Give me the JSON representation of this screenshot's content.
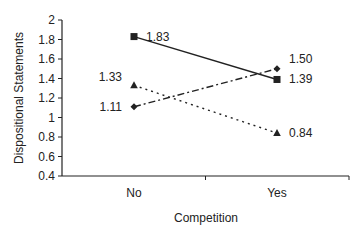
{
  "chart_data": {
    "type": "line",
    "title": "",
    "xlabel": "Competition",
    "ylabel": "Dispositional Statements",
    "categories": [
      "No",
      "Yes"
    ],
    "ylim": [
      0.4,
      2
    ],
    "yticks": [
      "0.4",
      "0.6",
      "0.8",
      "1",
      "1.2",
      "1.4",
      "1.6",
      "1.8",
      "2"
    ],
    "grid": false,
    "legend": null,
    "series": [
      {
        "name": "series-square-solid",
        "marker": "square",
        "line": "solid",
        "values": [
          1.83,
          1.39
        ],
        "labels": [
          "1.83",
          "1.39"
        ]
      },
      {
        "name": "series-diamond-dashdot",
        "marker": "diamond",
        "line": "dash-dot",
        "values": [
          1.11,
          1.5
        ],
        "labels": [
          "1.11",
          "1.50"
        ]
      },
      {
        "name": "series-triangle-dotted",
        "marker": "triangle",
        "line": "dotted",
        "values": [
          1.33,
          0.84
        ],
        "labels": [
          "1.33",
          "0.84"
        ]
      }
    ]
  }
}
